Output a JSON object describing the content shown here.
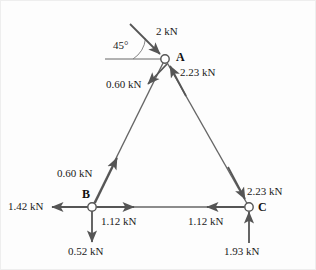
{
  "figure": {
    "background_color": "#fdfdfd",
    "stroke_color": "#555555",
    "text_color": "#1a1a1a",
    "border_color": "#e6e6e6"
  },
  "joints": [
    {
      "id": "A",
      "label": "A",
      "x": 165,
      "y": 59
    },
    {
      "id": "B",
      "label": "B",
      "x": 92,
      "y": 207
    },
    {
      "id": "C",
      "label": "C",
      "x": 249,
      "y": 207
    }
  ],
  "angle": {
    "label": "45°",
    "value": 45,
    "unit": "degrees"
  },
  "forces": [
    {
      "name": "applied-load-a",
      "label": "2 kN",
      "magnitude": 2.0,
      "unit": "kN",
      "joint": "A"
    },
    {
      "name": "member-ac-force-at-a",
      "label": "2.23 kN",
      "magnitude": 2.23,
      "unit": "kN",
      "joint": "A"
    },
    {
      "name": "member-ab-force-at-a",
      "label": "0.60 kN",
      "magnitude": 0.6,
      "unit": "kN",
      "joint": "A"
    },
    {
      "name": "member-ab-force-at-b",
      "label": "0.60 kN",
      "magnitude": 0.6,
      "unit": "kN",
      "joint": "B"
    },
    {
      "name": "reaction-bx",
      "label": "1.42 kN",
      "magnitude": 1.42,
      "unit": "kN",
      "joint": "B"
    },
    {
      "name": "member-bc-force-at-b",
      "label": "1.12 kN",
      "magnitude": 1.12,
      "unit": "kN",
      "joint": "B"
    },
    {
      "name": "reaction-by",
      "label": "0.52 kN",
      "magnitude": 0.52,
      "unit": "kN",
      "joint": "B"
    },
    {
      "name": "member-ac-force-at-c",
      "label": "2.23 kN",
      "magnitude": 2.23,
      "unit": "kN",
      "joint": "C"
    },
    {
      "name": "member-bc-force-at-c",
      "label": "1.12 kN",
      "magnitude": 1.12,
      "unit": "kN",
      "joint": "C"
    },
    {
      "name": "reaction-cy",
      "label": "1.93 kN",
      "magnitude": 1.93,
      "unit": "kN",
      "joint": "C"
    }
  ],
  "labels": {
    "load_2kn": "2 kN",
    "a_right_223": "2.23 kN",
    "a_left_060": "0.60 kN",
    "b_upper_060": "0.60 kN",
    "b_left_142": "1.42 kN",
    "b_right_112": "1.12 kN",
    "b_down_052": "0.52 kN",
    "c_upper_223": "2.23 kN",
    "c_left_112": "1.12 kN",
    "c_up_193": "1.93 kN",
    "node_a": "A",
    "node_b": "B",
    "node_c": "C",
    "angle_45": "45°"
  }
}
